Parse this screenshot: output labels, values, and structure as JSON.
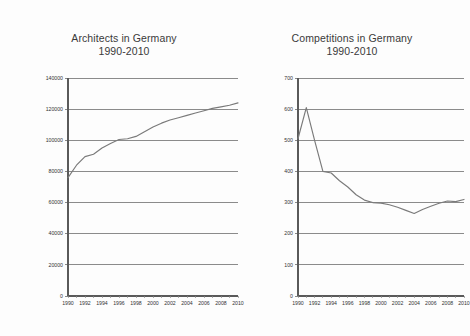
{
  "figure": {
    "background_color": "#fdfdfd",
    "line_color": "#7a7a7a",
    "grid_color": "#6e6e6e",
    "text_color": "#333333"
  },
  "chart_data": [
    {
      "type": "line",
      "id": "architects",
      "title": "Architects in Germany",
      "subtitle": "1990-2010",
      "xlabel": "",
      "ylabel": "",
      "grid": true,
      "legend": "none",
      "xlim": [
        1990,
        2010
      ],
      "ylim": [
        0,
        140000
      ],
      "ytick_labels": [
        "0",
        "20000",
        "40000",
        "60000",
        "80000",
        "100000",
        "120000",
        "140000"
      ],
      "ytick_values": [
        0,
        20000,
        40000,
        60000,
        80000,
        100000,
        120000,
        140000
      ],
      "xtick_labels": [
        "1990",
        "1992",
        "1994",
        "1996",
        "1998",
        "2000",
        "2002",
        "2004",
        "2006",
        "2008",
        "2010"
      ],
      "xtick_values": [
        1990,
        1992,
        1994,
        1996,
        1998,
        2000,
        2002,
        2004,
        2006,
        2008,
        2010
      ],
      "x": [
        1990,
        1991,
        1992,
        1993,
        1994,
        1995,
        1996,
        1997,
        1998,
        1999,
        2000,
        2001,
        2002,
        2003,
        2004,
        2005,
        2006,
        2007,
        2008,
        2009,
        2010
      ],
      "values": [
        76000,
        84000,
        89500,
        91000,
        95000,
        98000,
        100500,
        101000,
        102500,
        105500,
        108500,
        111000,
        113000,
        114500,
        116000,
        117500,
        119000,
        120500,
        121500,
        122500,
        124000
      ],
      "series": [
        {
          "name": "Architects",
          "values": [
            76000,
            84000,
            89500,
            91000,
            95000,
            98000,
            100500,
            101000,
            102500,
            105500,
            108500,
            111000,
            113000,
            114500,
            116000,
            117500,
            119000,
            120500,
            121500,
            122500,
            124000
          ]
        }
      ]
    },
    {
      "type": "line",
      "id": "competitions",
      "title": "Competitions in Germany",
      "subtitle": "1990-2010",
      "xlabel": "",
      "ylabel": "",
      "grid": true,
      "legend": "none",
      "xlim": [
        1990,
        2010
      ],
      "ylim": [
        0,
        700
      ],
      "ytick_labels": [
        "0",
        "100",
        "200",
        "300",
        "400",
        "500",
        "600",
        "700"
      ],
      "ytick_values": [
        0,
        100,
        200,
        300,
        400,
        500,
        600,
        700
      ],
      "xtick_labels": [
        "1990",
        "1992",
        "1994",
        "1996",
        "1998",
        "2000",
        "2002",
        "2004",
        "2006",
        "2008",
        "2010"
      ],
      "xtick_values": [
        1990,
        1992,
        1994,
        1996,
        1998,
        2000,
        2002,
        2004,
        2006,
        2008,
        2010
      ],
      "x": [
        1990,
        1991,
        1992,
        1993,
        1994,
        1995,
        1996,
        1997,
        1998,
        1999,
        2000,
        2001,
        2002,
        2003,
        2004,
        2005,
        2006,
        2007,
        2008,
        2009,
        2010
      ],
      "values": [
        505,
        605,
        500,
        400,
        395,
        370,
        350,
        325,
        308,
        300,
        298,
        293,
        285,
        275,
        265,
        278,
        288,
        298,
        305,
        303,
        310
      ],
      "series": [
        {
          "name": "Competitions",
          "values": [
            505,
            605,
            500,
            400,
            395,
            370,
            350,
            325,
            308,
            300,
            298,
            293,
            285,
            275,
            265,
            278,
            288,
            298,
            305,
            303,
            310
          ]
        }
      ]
    }
  ]
}
